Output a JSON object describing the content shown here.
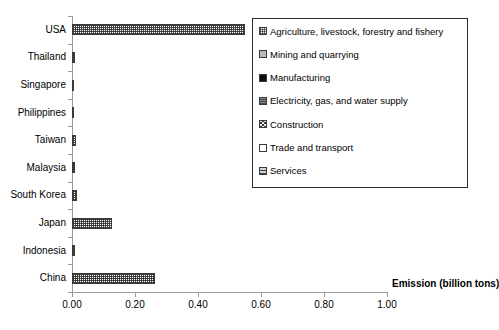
{
  "chart_data": {
    "type": "bar",
    "orientation": "horizontal",
    "title": "",
    "subtitle": "",
    "xlabel": "Emission (billion tons)",
    "ylabel": "",
    "xlim": [
      0.0,
      1.0
    ],
    "xticks": [
      "0.00",
      "0.20",
      "0.40",
      "0.60",
      "0.80",
      "1.00"
    ],
    "xtick_values": [
      0.0,
      0.2,
      0.4,
      0.6,
      0.8,
      1.0
    ],
    "grid": false,
    "legend_position": "upper right (inside plot)",
    "categories": [
      "USA",
      "Thailand",
      "Singapore",
      "Philippines",
      "Taiwan",
      "Malaysia",
      "South Korea",
      "Japan",
      "Indonesia",
      "China"
    ],
    "values": [
      0.55,
      0.011,
      0.004,
      0.005,
      0.014,
      0.009,
      0.016,
      0.127,
      0.009,
      0.265
    ],
    "series": [
      {
        "name": "Agriculture, livestock, forestry and fishery",
        "swatch": "sw-agriculture"
      },
      {
        "name": "Mining and quarrying",
        "swatch": "sw-mining"
      },
      {
        "name": "Manufacturing",
        "swatch": "sw-manufacturing"
      },
      {
        "name": "Electricity, gas, and water supply",
        "swatch": "sw-electricity"
      },
      {
        "name": "Construction",
        "swatch": "sw-construction"
      },
      {
        "name": "Trade and transport",
        "swatch": "sw-trade"
      },
      {
        "name": "Services",
        "swatch": "sw-services"
      }
    ],
    "legend_labels": [
      "Agriculture, livestock, forestry and fishery",
      "Mining and quarrying",
      "Manufacturing",
      "Electricity, gas, and water supply",
      "Construction",
      "Trade and transport",
      "Services"
    ],
    "colors": {
      "axis": "#9a9a9a",
      "bar_outline": "#3a3a3a",
      "legend_border": "#2b2b2b",
      "text": "#000000",
      "background": "#ffffff"
    }
  }
}
